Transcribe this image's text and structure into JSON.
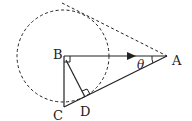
{
  "diagram": {
    "labels": {
      "A": "A",
      "B": "B",
      "C": "C",
      "D": "D",
      "angle": "θ"
    },
    "points": {
      "A": [
        167,
        56
      ],
      "B": [
        64,
        56
      ],
      "C": [
        64,
        107
      ],
      "D": [
        85,
        97
      ]
    },
    "circle": {
      "center": "B",
      "radius": 46,
      "style": "dashed"
    },
    "tangent_line": {
      "from": [
        62,
        3
      ],
      "to": [
        167,
        56
      ],
      "style": "dashed"
    },
    "right_angles": [
      "B",
      "D"
    ],
    "arrow_on_segment": "BA",
    "stroke_color": "#222222"
  }
}
